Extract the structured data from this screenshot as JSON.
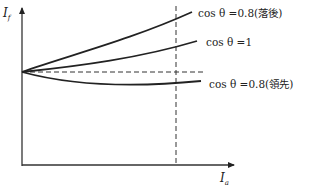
{
  "diagram": {
    "y_axis_label": "I",
    "y_axis_subscript": "f",
    "x_axis_label": "I",
    "x_axis_subscript": "a",
    "curves": [
      {
        "id": "lagging",
        "label": "cos θ =0.8(落後)",
        "trend": "rising steeply"
      },
      {
        "id": "unity",
        "label": "cos θ =1",
        "trend": "rising"
      },
      {
        "id": "leading",
        "label": "cos θ =0.8(領先)",
        "trend": "slightly falling"
      }
    ],
    "reference_lines": [
      "horizontal dashed at no-load field current",
      "vertical dashed at rated armature current"
    ]
  }
}
